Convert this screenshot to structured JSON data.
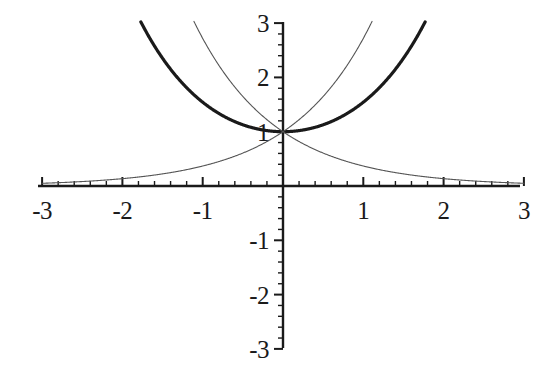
{
  "chart_data": {
    "type": "line",
    "title": "",
    "xlabel": "",
    "ylabel": "",
    "xlim": [
      -3,
      3
    ],
    "ylim": [
      -3,
      3
    ],
    "grid": false,
    "legend": "none",
    "axis_style": "cartesian-cross",
    "x_major_ticks": [
      -3,
      -2,
      -1,
      1,
      2,
      3
    ],
    "x_tick_labels": [
      "-3",
      "-2",
      "-1",
      "1",
      "2",
      "3"
    ],
    "y_major_ticks": [
      3,
      2,
      1,
      -1,
      -2,
      -3
    ],
    "y_tick_labels": [
      "3",
      "2",
      "1",
      "-1",
      "-2",
      "-3"
    ],
    "minor_tick_step": 0.2,
    "series": [
      {
        "name": "cosh(x)",
        "expression": "cosh(x)",
        "style": "thick",
        "color": "#1a1a1a",
        "line_width": 3.2,
        "domain": [
          -1.77,
          1.77
        ],
        "x": [
          -1.77,
          -1.5,
          -1.25,
          -1.0,
          -0.75,
          -0.5,
          -0.25,
          0,
          0.25,
          0.5,
          0.75,
          1.0,
          1.25,
          1.5,
          1.77
        ],
        "y": [
          3.01,
          2.35,
          1.89,
          1.54,
          1.29,
          1.13,
          1.03,
          1.0,
          1.03,
          1.13,
          1.29,
          1.54,
          1.89,
          2.35,
          3.01
        ]
      },
      {
        "name": "e^x",
        "expression": "exp(x)",
        "style": "thin",
        "color": "#555555",
        "line_width": 1.1,
        "domain": [
          -3,
          1.77
        ],
        "x": [
          -3,
          -2.5,
          -2,
          -1.5,
          -1,
          -0.5,
          0,
          0.5,
          1,
          1.5,
          1.77
        ],
        "y": [
          0.05,
          0.08,
          0.14,
          0.22,
          0.37,
          0.61,
          1.0,
          1.65,
          2.72,
          4.48,
          5.87
        ]
      },
      {
        "name": "e^-x",
        "expression": "exp(-x)",
        "style": "thin",
        "color": "#555555",
        "line_width": 1.1,
        "domain": [
          -1.77,
          3
        ],
        "x": [
          -1.77,
          -1.5,
          -1,
          -0.5,
          0,
          0.5,
          1,
          1.5,
          2,
          2.5,
          3
        ],
        "y": [
          5.87,
          4.48,
          2.72,
          1.65,
          1.0,
          0.61,
          0.37,
          0.22,
          0.14,
          0.08,
          0.05
        ]
      }
    ]
  },
  "geometry": {
    "origin_x": 283,
    "origin_y": 186,
    "px_per_unit_x": 80.3,
    "px_per_unit_y": 54.3,
    "axis_x_min_px": 38,
    "axis_x_max_px": 520,
    "axis_y_top_px": 22,
    "axis_y_bottom_px": 348
  }
}
